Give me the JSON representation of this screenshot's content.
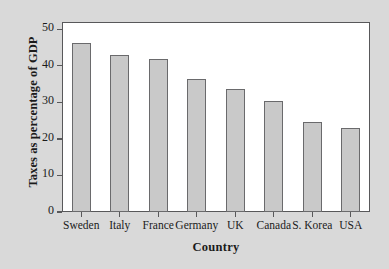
{
  "chart_data": {
    "type": "bar",
    "title": "",
    "xlabel": "Country",
    "ylabel": "Taxes as percentage of GDP",
    "categories": [
      "Sweden",
      "Italy",
      "France",
      "Germany",
      "UK",
      "Canada",
      "S. Korea",
      "USA"
    ],
    "values": [
      46.2,
      43.1,
      41.8,
      36.5,
      33.8,
      30.5,
      24.5,
      23.0
    ],
    "ylim": [
      0,
      52
    ],
    "yticks": [
      0,
      10,
      20,
      30,
      40,
      50
    ],
    "ytick_labels": [
      "0",
      "10",
      "20",
      "30",
      "40",
      "50"
    ],
    "grid": false,
    "legend": "none",
    "bar_color": "#c9c9c9",
    "bar_edge_color": "#6a6a6c",
    "plot_background": "#ffffff",
    "figure_background": "#d9d9d9",
    "axis_color": "#58585a"
  }
}
